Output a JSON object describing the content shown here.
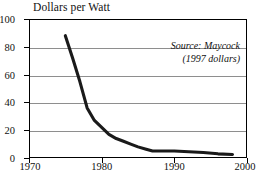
{
  "chart_data": {
    "type": "line",
    "title": "Dollars per Watt",
    "xlabel": "",
    "ylabel": "",
    "xlim": [
      1970,
      2000
    ],
    "ylim": [
      0,
      100
    ],
    "xticks": [
      1970,
      1980,
      1990,
      2000
    ],
    "yticks": [
      0,
      20,
      40,
      60,
      80,
      100
    ],
    "grid": "horizontal",
    "legend": "none",
    "annotations": [
      "Source: Maycock",
      "(1997 dollars)"
    ],
    "series": [
      {
        "name": "Photovoltaic module price",
        "color": "#1a1a1a",
        "x": [
          1975,
          1976,
          1977,
          1978,
          1979,
          1980,
          1981,
          1982,
          1983,
          1984,
          1985,
          1986,
          1987,
          1988,
          1990,
          1992,
          1994,
          1996,
          1998
        ],
        "values": [
          88,
          72,
          55,
          36,
          27,
          22,
          17,
          14,
          12,
          10,
          8,
          6.5,
          5,
          5,
          5,
          4.5,
          4,
          3,
          2.5
        ]
      }
    ]
  }
}
